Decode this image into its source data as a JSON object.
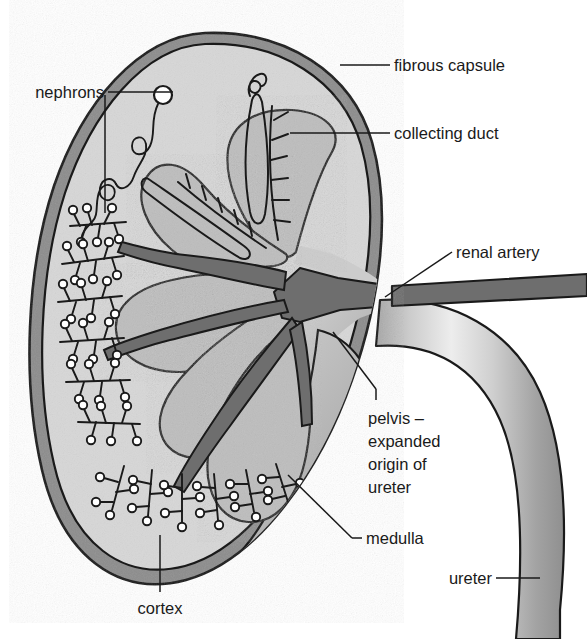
{
  "figure": {
    "background_color": "#ffffff"
  },
  "labels": {
    "fibrous_capsule": "fibrous capsule",
    "collecting_duct": "collecting duct",
    "renal_artery": "renal artery",
    "nephrons": "nephrons",
    "cortex": "cortex",
    "medulla": "medulla",
    "ureter": "ureter",
    "pelvis_line1": "pelvis –",
    "pelvis_line2": "expanded",
    "pelvis_line3": "origin of",
    "pelvis_line4": "ureter"
  },
  "colors": {
    "outline": "#1a1a1a",
    "capsule": "#8c8c8c",
    "cortex": "#d7d7d7",
    "medulla": "#bdbdbd",
    "pelvis": "#c9c9c9",
    "artery": "#6e6e6e",
    "ureter_light": "#e4e4e4",
    "ureter_mid": "#bdbdbd",
    "ureter_dark": "#9a9a9a",
    "label_text": "#1a1a1a"
  }
}
